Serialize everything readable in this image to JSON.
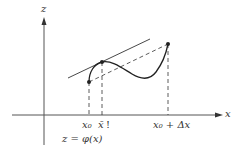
{
  "diagram": {
    "axes": {
      "z_label": "z",
      "x_label": "x"
    },
    "points": [
      {
        "id": "x0",
        "label": "x₀"
      },
      {
        "id": "xbar",
        "label": "x̄"
      },
      {
        "id": "x0_plus_dx",
        "label": "x₀ + Δx"
      }
    ],
    "xbar_suffix": "!",
    "function_label": "z = φ(x)",
    "colors": {
      "stroke": "#333333",
      "background": "#ffffff"
    }
  }
}
